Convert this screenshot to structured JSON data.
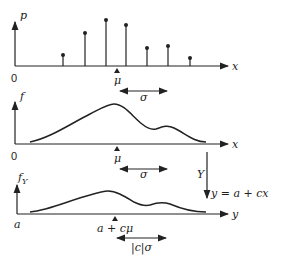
{
  "panels": [
    {
      "id": "pmf",
      "y_label": "p",
      "x_label": "x",
      "origin_label": "0",
      "mean_label": "μ",
      "spread_label": "σ",
      "stems": [
        {
          "x": 63,
          "top": 55
        },
        {
          "x": 85,
          "top": 33
        },
        {
          "x": 106,
          "top": 20
        },
        {
          "x": 126,
          "top": 25
        },
        {
          "x": 147,
          "top": 48
        },
        {
          "x": 168,
          "top": 46
        },
        {
          "x": 190,
          "top": 58
        }
      ]
    },
    {
      "id": "pdf",
      "y_label": "f",
      "x_label": "x",
      "origin_label": "0",
      "mean_label": "μ",
      "spread_label": "σ"
    },
    {
      "id": "transformed-pdf",
      "y_label": "f",
      "y_label_sub": "Y",
      "x_label": "y",
      "origin_label": "a",
      "mean_label": "a + cμ",
      "spread_label": "|c|σ"
    }
  ],
  "transform": {
    "variable": "Y",
    "equation": "y = a + cx"
  }
}
